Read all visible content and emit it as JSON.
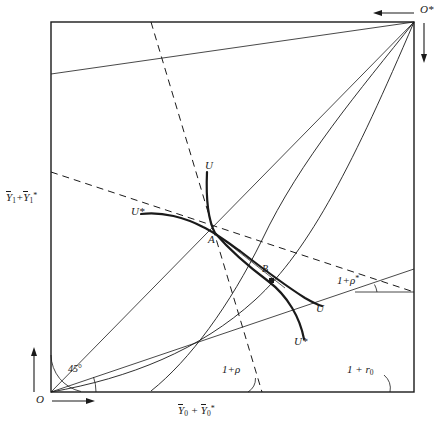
{
  "figure": {
    "background_color": "#ffffff",
    "line_color": "#1a1a1a",
    "frame": {
      "left": 51,
      "top": 22,
      "right": 414,
      "bottom": 392
    }
  },
  "axis_labels": {
    "y_axis": {
      "text": "Ȳ₁+Ȳ₁*",
      "base": "Y",
      "sub": "1",
      "star": "*",
      "x": 8,
      "y": 197
    },
    "x_axis": {
      "text": "Ȳ₀ + Ȳ₀*",
      "base": "Y",
      "sub": "0",
      "star": "*",
      "x": 180,
      "y": 411
    }
  },
  "corners": {
    "origin": {
      "label": "O",
      "x": 38,
      "y": 388
    },
    "foreign_origin": {
      "label": "O*",
      "x": 421,
      "y": 9
    }
  },
  "angles": [
    {
      "name": "forty-five-degree",
      "label": "45",
      "degree_symbol": "°",
      "x": 71,
      "y": 368
    },
    {
      "name": "one-plus-rho",
      "label": "1+ρ",
      "x": 228,
      "y": 369
    },
    {
      "name": "one-plus-r-zero",
      "label": "1 + r₀",
      "base": "1 + r",
      "sub": "0",
      "x": 350,
      "y": 369
    },
    {
      "name": "one-plus-rho-star",
      "label": "1+ρ*",
      "base": "1+ρ",
      "star": "*",
      "x": 341,
      "y": 279
    }
  ],
  "points": [
    {
      "name": "A",
      "label": "A",
      "x": 211,
      "y": 238,
      "marker": "none"
    },
    {
      "name": "B",
      "label": "B",
      "x": 265,
      "y": 270,
      "marker": "filled-square",
      "marker_x": 272,
      "marker_y": 281
    }
  ],
  "curve_labels": [
    {
      "name": "home-indifference-upper",
      "label": "U",
      "x": 207,
      "y": 164
    },
    {
      "name": "foreign-indifference-left",
      "label": "U*",
      "x": 134,
      "y": 210
    },
    {
      "name": "home-indifference-lower",
      "label": "U",
      "x": 318,
      "y": 308
    },
    {
      "name": "foreign-indifference-lower",
      "label": "U*",
      "x": 297,
      "y": 341
    }
  ],
  "chart_data": {
    "type": "line",
    "xlabel": "Ȳ₀ + Ȳ₀*",
    "ylabel": "Ȳ₁+Ȳ₁*",
    "grid": false,
    "legend": "none",
    "box": {
      "x0": 51,
      "y0": 392,
      "x1": 414,
      "y1": 22
    },
    "annotations": [
      "O",
      "O*",
      "A",
      "B",
      "U",
      "U*",
      "U",
      "U*",
      "45°",
      "1+ρ",
      "1+ρ*",
      "1 + r₀"
    ],
    "series": [
      {
        "name": "main-diagonal-O-to-Ostar",
        "style": "solid-thin",
        "points": [
          [
            51,
            392
          ],
          [
            414,
            22
          ]
        ]
      },
      {
        "name": "price-line-left-edge-to-Ostar",
        "style": "solid-thin",
        "points": [
          [
            51,
            74
          ],
          [
            414,
            22
          ]
        ]
      },
      {
        "name": "price-line-O-to-right-edge",
        "style": "solid-thin",
        "points": [
          [
            51,
            392
          ],
          [
            414,
            269
          ]
        ]
      },
      {
        "name": "transformation-curve-home",
        "style": "solid-thin-curve",
        "points": [
          [
            51,
            392
          ],
          [
            140,
            368
          ],
          [
            210,
            333
          ],
          [
            270,
            282
          ],
          [
            320,
            210
          ],
          [
            360,
            130
          ],
          [
            390,
            70
          ],
          [
            414,
            22
          ]
        ]
      },
      {
        "name": "transformation-curve-foreign",
        "style": "solid-thin-curve",
        "points": [
          [
            414,
            22
          ],
          [
            330,
            120
          ],
          [
            280,
            190
          ],
          [
            248,
            250
          ],
          [
            222,
            300
          ],
          [
            196,
            345
          ],
          [
            170,
            375
          ],
          [
            151,
            386
          ]
        ]
      },
      {
        "name": "budget-line-steep-dashed",
        "style": "dashed",
        "points": [
          [
            151,
            22
          ],
          [
            262,
            392
          ]
        ]
      },
      {
        "name": "budget-line-shallow-dashed",
        "style": "dashed",
        "points": [
          [
            51,
            172
          ],
          [
            414,
            292
          ]
        ]
      },
      {
        "name": "indifference-U-home",
        "style": "solid-thick",
        "points": [
          [
            207,
            170
          ],
          [
            209,
            196
          ],
          [
            212,
            221
          ],
          [
            216,
            234
          ],
          [
            228,
            248
          ],
          [
            245,
            264
          ],
          [
            262,
            277
          ],
          [
            283,
            292
          ],
          [
            300,
            320
          ],
          [
            305,
            338
          ]
        ]
      },
      {
        "name": "indifference-Ustar-foreign",
        "style": "solid-thick",
        "points": [
          [
            140,
            215
          ],
          [
            163,
            213
          ],
          [
            185,
            219
          ],
          [
            203,
            228
          ],
          [
            216,
            234
          ],
          [
            240,
            250
          ],
          [
            262,
            267
          ],
          [
            285,
            284
          ],
          [
            305,
            299
          ],
          [
            322,
            307
          ]
        ]
      }
    ]
  }
}
